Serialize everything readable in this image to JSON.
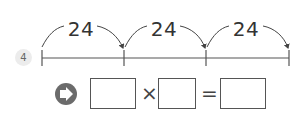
{
  "problem": {
    "number": "4",
    "number_line": {
      "jumps": [
        {
          "label": "24"
        },
        {
          "label": "24"
        },
        {
          "label": "24"
        }
      ],
      "tick_count": 4
    },
    "equation": {
      "icon": "arrow-right-circle-icon",
      "operator_multiply": "×",
      "operator_equals": "=",
      "box1_value": "",
      "box2_value": "",
      "result_value": ""
    }
  }
}
